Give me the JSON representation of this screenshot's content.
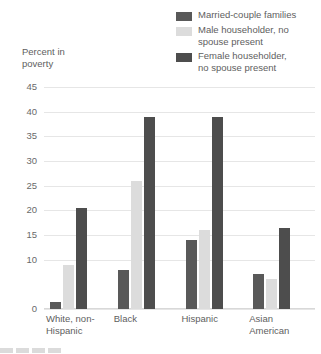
{
  "chart_data": {
    "type": "bar",
    "title": "",
    "subtitle": "",
    "xlabel": "",
    "ylabel": "Percent in\npoverty",
    "categories": [
      "White, non-\nHispanic",
      "Black",
      "Hispanic",
      "Asian\nAmerican"
    ],
    "series": [
      {
        "name": "Married-couple families",
        "color": "#595959",
        "values": [
          1.5,
          8,
          14,
          7
        ]
      },
      {
        "name": "Male householder, no\nspouse present",
        "color": "#dcdcdc",
        "values": [
          9,
          26,
          16,
          6
        ]
      },
      {
        "name": "Female householder,\nno spouse present",
        "color": "#4d4d4d",
        "values": [
          20.5,
          39,
          39,
          16.5
        ]
      }
    ],
    "ylim": [
      0,
      45
    ],
    "ytick_values": [
      45,
      40,
      35,
      30,
      25,
      20,
      15,
      10,
      0
    ],
    "ytick_labels": [
      "45",
      "40",
      "35",
      "30",
      "25",
      "20",
      "15",
      "10",
      "0"
    ],
    "grid": true,
    "legend_position": "top-right"
  },
  "bleed": {
    "text": ""
  }
}
